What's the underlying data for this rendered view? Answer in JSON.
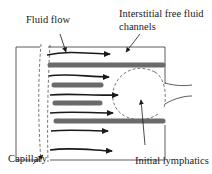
{
  "diagram": {
    "labels": {
      "fluid_flow": "Fluid flow",
      "channels_line1": "Interstitial free fluid",
      "channels_line2": "channels",
      "capillary": "Capillary",
      "initial_lymphatics": "Initial lymphatics"
    },
    "colors": {
      "bar": "#6b6b6b",
      "line": "#1a1a1a",
      "dashed": "#555555",
      "box": "#333333"
    },
    "elements": {
      "flow_arrows": 6,
      "fluid_channels": 5,
      "capillary_boundary": "dashed-line",
      "lymphatic_vessel": "dashed-circle"
    }
  }
}
